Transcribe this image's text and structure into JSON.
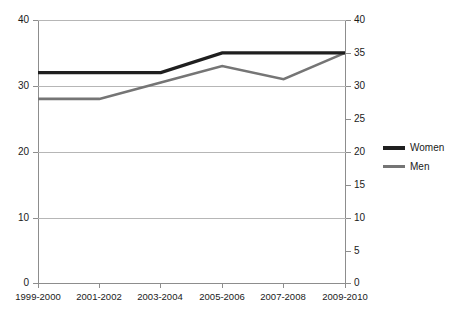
{
  "chart_data": {
    "type": "line",
    "title": "",
    "xlabel": "",
    "ylabel": "",
    "categories": [
      "1999-2000",
      "2001-2002",
      "2003-2004",
      "2005-2006",
      "2007-2008",
      "2009-2010"
    ],
    "series": [
      {
        "name": "Women",
        "color": "#1f1f1f",
        "values": [
          32,
          32,
          32,
          35,
          35,
          35
        ]
      },
      {
        "name": "Men",
        "color": "#757575",
        "values": [
          28,
          28,
          30.5,
          33,
          31,
          35
        ]
      }
    ],
    "ylim": [
      0,
      40
    ],
    "left_axis": {
      "min": 0,
      "max": 40,
      "step": 10,
      "ticks": [
        "0",
        "10",
        "20",
        "30",
        "40"
      ]
    },
    "right_axis": {
      "min": 0,
      "max": 40,
      "step": 5,
      "ticks": [
        "0",
        "5",
        "10",
        "15",
        "20",
        "25",
        "30",
        "35",
        "40"
      ]
    },
    "grid": true,
    "legend_position": "right",
    "legend": [
      {
        "label": "Women",
        "swatch": "line-swatch-women"
      },
      {
        "label": "Men",
        "swatch": "line-swatch-men"
      }
    ]
  }
}
